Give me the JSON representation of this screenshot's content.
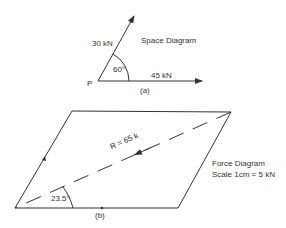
{
  "space_diagram": {
    "title": "Space Diagram",
    "point_label": "P",
    "force1_label": "30 kN",
    "force2_label": "45 kN",
    "angle_label": "60°",
    "caption": "(a)"
  },
  "force_diagram": {
    "title": "Force Diagram",
    "scale": "Scale 1cm = 5 kN",
    "resultant_label": "R = 65 k",
    "angle_label": "23.5°",
    "caption": "(b)"
  },
  "colors": {
    "line": "#333333",
    "background": "#ffffff"
  }
}
